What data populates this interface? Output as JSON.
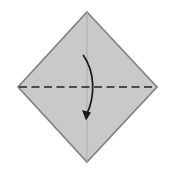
{
  "figure": {
    "canvas": {
      "width": 174,
      "height": 174,
      "background": "#ffffff"
    }
  },
  "shapes": {
    "paper": {
      "name": "diamond-paper",
      "points": "87,12 157,87 87,162 18,87",
      "fill": "#c9c9c9",
      "stroke": "#808080",
      "stroke_width": 1.6
    },
    "vertical_crease": {
      "name": "vertical-center-crease",
      "x1": 87,
      "y1": 12,
      "x2": 87,
      "y2": 162,
      "stroke": "#a8a8a8",
      "stroke_width": 0.9
    },
    "fold_line": {
      "name": "horizontal-fold-crease",
      "x1": 19,
      "y1": 87,
      "x2": 156,
      "y2": 87,
      "stroke": "#222222",
      "stroke_width": 1.5,
      "dash": "8 4.5"
    },
    "fold_arrow": {
      "name": "fold-direction-arrow",
      "path": "M 83.5,55.5 C 95,72 95.5,96 86.5,115",
      "stroke": "#1a1a1a",
      "stroke_width": 1.7,
      "head_points": "86.0,120.5 82.0,110.0 91.0,112.5",
      "head_fill": "#1a1a1a"
    }
  },
  "colors": {
    "paper_fill": "#c9c9c9",
    "paper_edge": "#808080",
    "crease_line": "#222222",
    "arrow": "#1a1a1a",
    "background": "#ffffff"
  }
}
